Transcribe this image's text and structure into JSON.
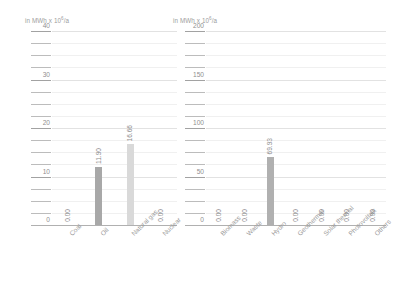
{
  "chart_data": [
    {
      "type": "bar",
      "title": "",
      "unit_label_prefix": "in MWh x 10",
      "unit_label_exponent": "6",
      "unit_label_suffix": "/a",
      "ylabel": "in MWh x 10^6/a",
      "xlabel": "",
      "categories": [
        "Coal",
        "Oil",
        "Natural gas",
        "Nuclear"
      ],
      "values": [
        0.0,
        11.9,
        16.66,
        0.0
      ],
      "value_labels": [
        "0.00",
        "11.90",
        "16.66",
        "0.00"
      ],
      "bar_colors": [
        "#b3b3b3",
        "#a8a8a8",
        "#d9d9d9",
        "#b3b3b3"
      ],
      "ylim": [
        0,
        40
      ],
      "yticks": [
        0,
        10,
        20,
        30,
        40
      ],
      "ytick_labels": [
        "0",
        "10",
        "20",
        "30",
        "40"
      ],
      "minor_ticks_between": 3,
      "grid": true,
      "legend": "none"
    },
    {
      "type": "bar",
      "title": "",
      "unit_label_prefix": "in MWh x 10",
      "unit_label_exponent": "6",
      "unit_label_suffix": "/a",
      "ylabel": "in MWh x 10^6/a",
      "xlabel": "",
      "categories": [
        "Biomass",
        "Waste",
        "Hydro",
        "Geothermal",
        "Solar thermal",
        "Photovoltaik",
        "Others"
      ],
      "values": [
        0.0,
        0.0,
        69.93,
        0.0,
        0.0,
        0.0,
        0.0
      ],
      "value_labels": [
        "0.00",
        "0.00",
        "69.93",
        "0.00",
        "0.00",
        "0.00",
        "0.00"
      ],
      "bar_colors": [
        "#b3b3b3",
        "#b3b3b3",
        "#b0b0b0",
        "#b3b3b3",
        "#b3b3b3",
        "#b3b3b3",
        "#b3b3b3"
      ],
      "ylim": [
        0,
        200
      ],
      "yticks": [
        0,
        50,
        100,
        150,
        200
      ],
      "ytick_labels": [
        "0",
        "50",
        "100",
        "150",
        "200"
      ],
      "minor_ticks_between": 3,
      "grid": true,
      "legend": "none"
    }
  ]
}
